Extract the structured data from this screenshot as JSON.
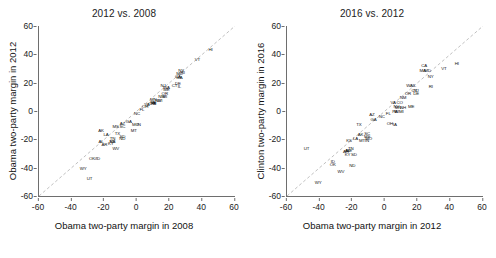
{
  "figure": {
    "panel_count": 2,
    "background": "#ffffff",
    "axis_color": "#6e6e6e",
    "label_color": "#111111",
    "refline_color": "#b9b9b9"
  },
  "chart_data": [
    {
      "type": "scatter",
      "title": "2012 vs. 2008",
      "xlabel": "Obama two-party margin in 2008",
      "ylabel": "Obama two-party margin in 2012",
      "xlim": [
        -60,
        60
      ],
      "ylim": [
        -60,
        60
      ],
      "xticks": [
        -60,
        -40,
        -20,
        0,
        20,
        40,
        60
      ],
      "yticks": [
        -60,
        -40,
        -20,
        0,
        20,
        40,
        60
      ],
      "grid": false,
      "legend": "none",
      "point_marker": "state-abbreviation-text",
      "annotations": [
        "dashed identity line y = x"
      ],
      "points": [
        {
          "label": "HI",
          "x": 45,
          "y": 43
        },
        {
          "label": "VT",
          "x": 37,
          "y": 36
        },
        {
          "label": "NY",
          "x": 27,
          "y": 28
        },
        {
          "label": "MD",
          "x": 26,
          "y": 26
        },
        {
          "label": "CA",
          "x": 25,
          "y": 24
        },
        {
          "label": "MA",
          "x": 26,
          "y": 23
        },
        {
          "label": "RI",
          "x": 28,
          "y": 27
        },
        {
          "label": "DE",
          "x": 25,
          "y": 19
        },
        {
          "label": "IL",
          "x": 26,
          "y": 17
        },
        {
          "label": "NJ",
          "x": 16,
          "y": 18
        },
        {
          "label": "CT",
          "x": 23,
          "y": 18
        },
        {
          "label": "WA",
          "x": 18,
          "y": 16
        },
        {
          "label": "ME",
          "x": 18,
          "y": 15
        },
        {
          "label": "OR",
          "x": 17,
          "y": 12
        },
        {
          "label": "MI",
          "x": 17,
          "y": 10
        },
        {
          "label": "NM",
          "x": 15,
          "y": 10
        },
        {
          "label": "MN",
          "x": 10,
          "y": 8
        },
        {
          "label": "WI",
          "x": 14,
          "y": 7
        },
        {
          "label": "NV",
          "x": 13,
          "y": 7
        },
        {
          "label": "IA",
          "x": 10,
          "y": 6
        },
        {
          "label": "NH",
          "x": 10,
          "y": 6
        },
        {
          "label": "PA",
          "x": 10,
          "y": 5
        },
        {
          "label": "CO",
          "x": 9,
          "y": 5
        },
        {
          "label": "VA",
          "x": 6,
          "y": 4
        },
        {
          "label": "OH",
          "x": 5,
          "y": 3
        },
        {
          "label": "FL",
          "x": 3,
          "y": 1
        },
        {
          "label": "NC",
          "x": 0,
          "y": -2
        },
        {
          "label": "IN",
          "x": 1,
          "y": -10
        },
        {
          "label": "GA",
          "x": -5,
          "y": -8
        },
        {
          "label": "AZ",
          "x": -9,
          "y": -9
        },
        {
          "label": "MO",
          "x": -1,
          "y": -10
        },
        {
          "label": "MT",
          "x": -2,
          "y": -14
        },
        {
          "label": "SC",
          "x": -9,
          "y": -11
        },
        {
          "label": "SD",
          "x": -9,
          "y": -18
        },
        {
          "label": "ND",
          "x": -9,
          "y": -20
        },
        {
          "label": "MS",
          "x": -13,
          "y": -11
        },
        {
          "label": "TN",
          "x": -15,
          "y": -20
        },
        {
          "label": "TX",
          "x": -12,
          "y": -16
        },
        {
          "label": "LA",
          "x": -19,
          "y": -17
        },
        {
          "label": "AK",
          "x": -22,
          "y": -14
        },
        {
          "label": "KS",
          "x": -15,
          "y": -22
        },
        {
          "label": "NB",
          "x": -15,
          "y": -22
        },
        {
          "label": "KY",
          "x": -16,
          "y": -23
        },
        {
          "label": "AL",
          "x": -22,
          "y": -22
        },
        {
          "label": "AR",
          "x": -20,
          "y": -24
        },
        {
          "label": "WV",
          "x": -13,
          "y": -27
        },
        {
          "label": "OK/ID",
          "x": -26,
          "y": -34
        },
        {
          "label": "WY",
          "x": -33,
          "y": -41
        },
        {
          "label": "UT",
          "x": -29,
          "y": -48
        }
      ]
    },
    {
      "type": "scatter",
      "title": "2016 vs. 2012",
      "xlabel": "Obama two-party margin in 2012",
      "ylabel": "Clinton two-party margin in 2016",
      "xlim": [
        -60,
        60
      ],
      "ylim": [
        -60,
        60
      ],
      "xticks": [
        -60,
        -40,
        -20,
        0,
        20,
        40,
        60
      ],
      "yticks": [
        -60,
        -40,
        -20,
        0,
        20,
        40,
        60
      ],
      "grid": false,
      "legend": "none",
      "point_marker": "state-abbreviation-text",
      "annotations": [
        "dashed identity line y = x"
      ],
      "points": [
        {
          "label": "HI",
          "x": 44,
          "y": 33
        },
        {
          "label": "VT",
          "x": 36,
          "y": 30
        },
        {
          "label": "CA",
          "x": 24,
          "y": 32
        },
        {
          "label": "MD",
          "x": 26,
          "y": 28
        },
        {
          "label": "MA",
          "x": 23,
          "y": 28
        },
        {
          "label": "NY",
          "x": 28,
          "y": 24
        },
        {
          "label": "RI",
          "x": 28,
          "y": 17
        },
        {
          "label": "WA",
          "x": 15,
          "y": 18
        },
        {
          "label": "IL",
          "x": 18,
          "y": 18
        },
        {
          "label": "CT",
          "x": 18,
          "y": 14
        },
        {
          "label": "NJ",
          "x": 19,
          "y": 14
        },
        {
          "label": "OR",
          "x": 14,
          "y": 12
        },
        {
          "label": "DE",
          "x": 19,
          "y": 12
        },
        {
          "label": "NM",
          "x": 11,
          "y": 9
        },
        {
          "label": "VA",
          "x": 5,
          "y": 6
        },
        {
          "label": "CO",
          "x": 9,
          "y": 6
        },
        {
          "label": "NV",
          "x": 7,
          "y": 3
        },
        {
          "label": "MN",
          "x": 8,
          "y": 2
        },
        {
          "label": "NH",
          "x": 11,
          "y": 2
        },
        {
          "label": "ME",
          "x": 16,
          "y": 3
        },
        {
          "label": "AZ",
          "x": -8,
          "y": -3
        },
        {
          "label": "NC",
          "x": -2,
          "y": -4
        },
        {
          "label": "FL",
          "x": 2,
          "y": -2
        },
        {
          "label": "PA",
          "x": 6,
          "y": -1
        },
        {
          "label": "WI",
          "x": 7,
          "y": -1
        },
        {
          "label": "MI",
          "x": 10,
          "y": -1
        },
        {
          "label": "GA",
          "x": -7,
          "y": -6
        },
        {
          "label": "OH",
          "x": 3,
          "y": -9
        },
        {
          "label": "IA",
          "x": 6,
          "y": -10
        },
        {
          "label": "TX",
          "x": -16,
          "y": -10
        },
        {
          "label": "SC",
          "x": -11,
          "y": -16
        },
        {
          "label": "AK",
          "x": -15,
          "y": -17
        },
        {
          "label": "MS",
          "x": -11,
          "y": -18
        },
        {
          "label": "MO",
          "x": -10,
          "y": -20
        },
        {
          "label": "KS",
          "x": -22,
          "y": -21
        },
        {
          "label": "MT",
          "x": -14,
          "y": -21
        },
        {
          "label": "IN",
          "x": -11,
          "y": -21
        },
        {
          "label": "LA",
          "x": -18,
          "y": -20
        },
        {
          "label": "TN",
          "x": -21,
          "y": -27
        },
        {
          "label": "AL",
          "x": -23,
          "y": -28
        },
        {
          "label": "NE",
          "x": -22,
          "y": -28
        },
        {
          "label": "KY",
          "x": -23,
          "y": -31
        },
        {
          "label": "SD",
          "x": -19,
          "y": -31
        },
        {
          "label": "AR",
          "x": -24,
          "y": -29
        },
        {
          "label": "ID",
          "x": -32,
          "y": -36
        },
        {
          "label": "OK",
          "x": -32,
          "y": -38
        },
        {
          "label": "ND",
          "x": -20,
          "y": -39
        },
        {
          "label": "WV",
          "x": -27,
          "y": -43
        },
        {
          "label": "UT",
          "x": -48,
          "y": -27
        },
        {
          "label": "WY",
          "x": -41,
          "y": -51
        }
      ]
    }
  ]
}
